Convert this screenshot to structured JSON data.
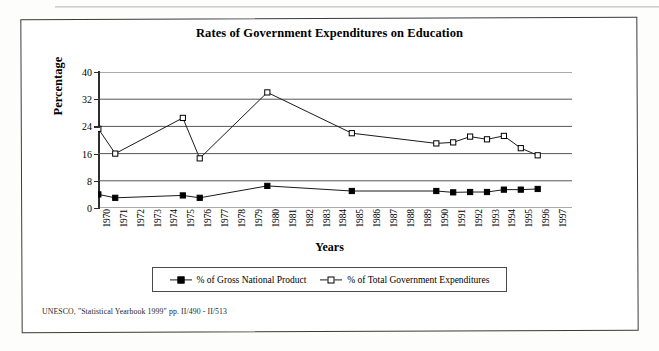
{
  "document": {
    "source_note": "UNESCO, \"Statistical Yearbook 1999\" pp. II/490 - II/513"
  },
  "chart_data": {
    "type": "line",
    "title": "Rates of Government Expenditures on Education",
    "xlabel": "Years",
    "ylabel": "Percentage",
    "ylim": [
      0,
      40
    ],
    "yticks": [
      0,
      8,
      16,
      24,
      32,
      40
    ],
    "grid": true,
    "legend_position": "bottom",
    "categories": [
      "1970",
      "1971",
      "1972",
      "1973",
      "1974",
      "1975",
      "1976",
      "1977",
      "1978",
      "1979",
      "1980",
      "1981",
      "1982",
      "1983",
      "1984",
      "1985",
      "1986",
      "1987",
      "1988",
      "1989",
      "1990",
      "1991",
      "1992",
      "1993",
      "1994",
      "1995",
      "1996",
      "1997"
    ],
    "series": [
      {
        "name": "% of Gross National Product",
        "marker": "filled-square",
        "points": [
          {
            "x": "1970",
            "y": 4.0
          },
          {
            "x": "1971",
            "y": 3.0
          },
          {
            "x": "1975",
            "y": 3.7
          },
          {
            "x": "1976",
            "y": 3.0
          },
          {
            "x": "1980",
            "y": 6.5
          },
          {
            "x": "1985",
            "y": 5.0
          },
          {
            "x": "1990",
            "y": 5.0
          },
          {
            "x": "1991",
            "y": 4.6
          },
          {
            "x": "1992",
            "y": 4.7
          },
          {
            "x": "1993",
            "y": 4.7
          },
          {
            "x": "1994",
            "y": 5.4
          },
          {
            "x": "1995",
            "y": 5.4
          },
          {
            "x": "1996",
            "y": 5.6
          }
        ]
      },
      {
        "name": "% of Total Government Expenditures",
        "marker": "hollow-square",
        "points": [
          {
            "x": "1970",
            "y": 23.3
          },
          {
            "x": "1971",
            "y": 16.0
          },
          {
            "x": "1975",
            "y": 26.5
          },
          {
            "x": "1976",
            "y": 14.6
          },
          {
            "x": "1980",
            "y": 34.0
          },
          {
            "x": "1985",
            "y": 22.0
          },
          {
            "x": "1990",
            "y": 19.0
          },
          {
            "x": "1991",
            "y": 19.3
          },
          {
            "x": "1992",
            "y": 21.0
          },
          {
            "x": "1993",
            "y": 20.2
          },
          {
            "x": "1994",
            "y": 21.2
          },
          {
            "x": "1995",
            "y": 17.6
          },
          {
            "x": "1996",
            "y": 15.5
          }
        ]
      }
    ]
  }
}
